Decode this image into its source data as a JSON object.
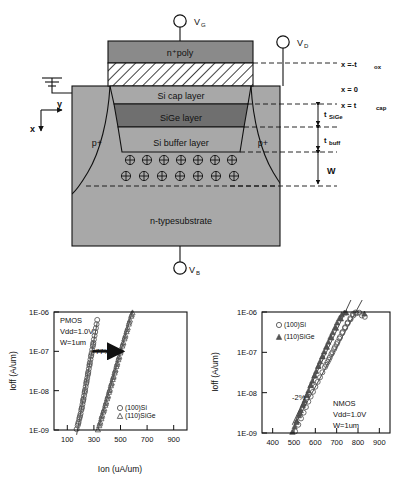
{
  "diagram": {
    "name": "MOSFET cross-section",
    "terminals": [
      {
        "id": "gate",
        "label": "V",
        "sub": "G"
      },
      {
        "id": "drain",
        "label": "V",
        "sub": "D"
      },
      {
        "id": "body",
        "label": "V",
        "sub": "B"
      }
    ],
    "axes": {
      "horizontal": "y",
      "vertical": "x"
    },
    "layers": [
      {
        "id": "poly",
        "label": "n⁺poly",
        "fill": "#8a8a8a"
      },
      {
        "id": "oxide",
        "label": "",
        "fill": "hatch"
      },
      {
        "id": "cap",
        "label": "Si cap layer",
        "fill": "#a8a8a8"
      },
      {
        "id": "sige",
        "label": "SiGe layer",
        "fill": "#6f6f6f"
      },
      {
        "id": "buffer",
        "label": "Si buffer layer",
        "fill": "#a8a8a8"
      },
      {
        "id": "substrate",
        "label": "n-typesubstrate",
        "fill": "#a8a8a8"
      }
    ],
    "source_label": "p+",
    "drain_label": "p+",
    "depletion_charge_symbol": "⊕",
    "depletion_rows": 2,
    "depletion_cols": 7,
    "markers": [
      {
        "id": "tox",
        "text": "x =-t",
        "sub": "ox"
      },
      {
        "id": "x0",
        "text": "x  =  0",
        "sub": ""
      },
      {
        "id": "xcap",
        "text": "x  =  t",
        "sub": "cap"
      },
      {
        "id": "tsige",
        "text": "t",
        "sub": "SiGe"
      },
      {
        "id": "tbuff",
        "text": "t",
        "sub": "buff"
      },
      {
        "id": "w",
        "text": "W",
        "sub": ""
      }
    ],
    "ground_symbol": "ground"
  },
  "chart_data": [
    {
      "id": "pmos",
      "type": "scatter",
      "title": "",
      "xlabel": "Ion (uA/um)",
      "ylabel": "Ioff (A/um)",
      "xlim": [
        0,
        1000
      ],
      "xticks": [
        100,
        300,
        500,
        700,
        900
      ],
      "ylim_exp": [
        -9,
        -6
      ],
      "yticks": [
        "1E-06",
        "1E-07",
        "1E-08",
        "1E-09"
      ],
      "grid": false,
      "legend_position": "bottom-right",
      "annotations": [
        {
          "id": "device",
          "text": "PMOS"
        },
        {
          "id": "vdd",
          "text": "Vdd=1.0V"
        },
        {
          "id": "width",
          "text": "W=1um"
        },
        {
          "id": "gain",
          "text": "+77%"
        }
      ],
      "arrow": {
        "from_x": 290,
        "to_x": 515,
        "at_y": "1E-07",
        "label": "+77%"
      },
      "series": [
        {
          "name": "(100)Si",
          "marker": "circle",
          "points": [
            [
              170,
              1.05e-09
            ],
            [
              178,
              1.3e-09
            ],
            [
              185,
              1.6e-09
            ],
            [
              190,
              1.9e-09
            ],
            [
              196,
              2.3e-09
            ],
            [
              200,
              2.6e-09
            ],
            [
              205,
              3.2e-09
            ],
            [
              210,
              3.8e-09
            ],
            [
              214,
              4.5e-09
            ],
            [
              218,
              5.3e-09
            ],
            [
              222,
              6.2e-09
            ],
            [
              226,
              7.4e-09
            ],
            [
              230,
              8.8e-09
            ],
            [
              234,
              1.05e-08
            ],
            [
              238,
              1.25e-08
            ],
            [
              242,
              1.5e-08
            ],
            [
              246,
              1.8e-08
            ],
            [
              250,
              2.1e-08
            ],
            [
              254,
              2.5e-08
            ],
            [
              258,
              3e-08
            ],
            [
              262,
              3.6e-08
            ],
            [
              266,
              4.3e-08
            ],
            [
              270,
              5.2e-08
            ],
            [
              274,
              6.2e-08
            ],
            [
              278,
              7.4e-08
            ],
            [
              283,
              9e-08
            ],
            [
              287,
              1.1e-07
            ],
            [
              292,
              1.35e-07
            ],
            [
              296,
              1.65e-07
            ],
            [
              300,
              2e-07
            ],
            [
              305,
              2.5e-07
            ],
            [
              310,
              3.1e-07
            ],
            [
              315,
              3.9e-07
            ],
            [
              320,
              4.9e-07
            ],
            [
              325,
              6.3e-07
            ],
            [
              182,
              1.45e-09
            ],
            [
              193,
              2.1e-09
            ],
            [
              208,
              3.5e-09
            ],
            [
              220,
              5.8e-09
            ],
            [
              232,
              9.6e-09
            ],
            [
              244,
              1.65e-08
            ],
            [
              256,
              2.75e-08
            ],
            [
              268,
              4.7e-08
            ],
            [
              280,
              8e-08
            ],
            [
              294,
              1.5e-07
            ]
          ]
        },
        {
          "name": "(110)SiGe",
          "marker": "triangle",
          "points": [
            [
              330,
              1.02e-09
            ],
            [
              340,
              1.3e-09
            ],
            [
              348,
              1.6e-09
            ],
            [
              356,
              1.95e-09
            ],
            [
              362,
              2.4e-09
            ],
            [
              370,
              2.9e-09
            ],
            [
              378,
              3.5e-09
            ],
            [
              385,
              4.3e-09
            ],
            [
              392,
              5.2e-09
            ],
            [
              399,
              6.3e-09
            ],
            [
              406,
              7.6e-09
            ],
            [
              413,
              9.2e-09
            ],
            [
              420,
              1.1e-08
            ],
            [
              427,
              1.35e-08
            ],
            [
              434,
              1.6e-08
            ],
            [
              441,
              1.95e-08
            ],
            [
              448,
              2.35e-08
            ],
            [
              455,
              2.85e-08
            ],
            [
              462,
              3.45e-08
            ],
            [
              469,
              4.2e-08
            ],
            [
              476,
              5.1e-08
            ],
            [
              483,
              6.2e-08
            ],
            [
              490,
              7.5e-08
            ],
            [
              498,
              9.2e-08
            ],
            [
              505,
              1.12e-07
            ],
            [
              513,
              1.38e-07
            ],
            [
              521,
              1.7e-07
            ],
            [
              529,
              2.1e-07
            ],
            [
              537,
              2.6e-07
            ],
            [
              545,
              3.2e-07
            ],
            [
              554,
              4e-07
            ],
            [
              562,
              5e-07
            ],
            [
              571,
              6.3e-07
            ],
            [
              580,
              7.9e-07
            ],
            [
              590,
              9.6e-07
            ],
            [
              344,
              1.45e-09
            ],
            [
              358,
              2.2e-09
            ],
            [
              374,
              3.2e-09
            ],
            [
              389,
              4.8e-09
            ],
            [
              403,
              7e-09
            ],
            [
              417,
              1.02e-08
            ],
            [
              431,
              1.5e-08
            ],
            [
              445,
              2.2e-08
            ],
            [
              459,
              3.2e-08
            ],
            [
              473,
              4.7e-08
            ],
            [
              487,
              6.9e-08
            ],
            [
              501,
              1.02e-07
            ],
            [
              517,
              1.55e-07
            ],
            [
              533,
              2.35e-07
            ],
            [
              549,
              3.6e-07
            ],
            [
              566,
              5.6e-07
            ],
            [
              584,
              8.6e-07
            ]
          ]
        }
      ]
    },
    {
      "id": "nmos",
      "type": "scatter",
      "title": "",
      "xlabel": "",
      "ylabel": "Ioff (A/um)",
      "xlim": [
        350,
        950
      ],
      "xticks": [
        400,
        500,
        600,
        700,
        800,
        900
      ],
      "ylim_exp": [
        -9,
        -6
      ],
      "yticks": [
        "1E-06",
        "1E-07",
        "1E-08",
        "1E-09"
      ],
      "grid": false,
      "legend_position": "top-left",
      "annotations": [
        {
          "id": "device",
          "text": "NMOS"
        },
        {
          "id": "vdd",
          "text": "Vdd=1.0V"
        },
        {
          "id": "width",
          "text": "W=1um"
        },
        {
          "id": "gain",
          "text": "-2%"
        }
      ],
      "series": [
        {
          "name": "(100)Si",
          "marker": "circle",
          "points": [
            [
              505,
              1.1e-09
            ],
            [
              520,
              1.6e-09
            ],
            [
              533,
              2.3e-09
            ],
            [
              545,
              3.2e-09
            ],
            [
              556,
              4.4e-09
            ],
            [
              567,
              6e-09
            ],
            [
              578,
              8e-09
            ],
            [
              589,
              1.05e-08
            ],
            [
              600,
              1.4e-08
            ],
            [
              611,
              1.85e-08
            ],
            [
              622,
              2.4e-08
            ],
            [
              633,
              3.2e-08
            ],
            [
              645,
              4.3e-08
            ],
            [
              657,
              5.7e-08
            ],
            [
              668,
              7.5e-08
            ],
            [
              680,
              1e-07
            ],
            [
              692,
              1.35e-07
            ],
            [
              704,
              1.8e-07
            ],
            [
              716,
              2.4e-07
            ],
            [
              728,
              3.2e-07
            ],
            [
              740,
              4.2e-07
            ],
            [
              752,
              5.5e-07
            ],
            [
              764,
              7e-07
            ],
            [
              776,
              8.8e-07
            ],
            [
              788,
              9.7e-07
            ],
            [
              650,
              4.9e-08
            ],
            [
              663,
              6.6e-08
            ],
            [
              675,
              9e-08
            ],
            [
              688,
              1.2e-07
            ],
            [
              700,
              1.6e-07
            ],
            [
              713,
              2.2e-07
            ],
            [
              726,
              3e-07
            ],
            [
              739,
              4e-07
            ],
            [
              751,
              5.2e-07
            ],
            [
              765,
              6.6e-07
            ],
            [
              778,
              8.2e-07
            ],
            [
              792,
              9.3e-07
            ],
            [
              806,
              9.6e-07
            ],
            [
              818,
              8.2e-07
            ],
            [
              832,
              7.6e-07
            ]
          ]
        },
        {
          "name": "(110)SiGe",
          "marker": "triangle-f",
          "points": [
            [
              492,
              1.05e-09
            ],
            [
              503,
              1.45e-09
            ],
            [
              513,
              2e-09
            ],
            [
              523,
              2.7e-09
            ],
            [
              532,
              3.6e-09
            ],
            [
              541,
              4.8e-09
            ],
            [
              550,
              6.4e-09
            ],
            [
              559,
              8.5e-09
            ],
            [
              568,
              1.12e-08
            ],
            [
              577,
              1.5e-08
            ],
            [
              586,
              1.95e-08
            ],
            [
              595,
              2.6e-08
            ],
            [
              604,
              3.4e-08
            ],
            [
              613,
              4.5e-08
            ],
            [
              622,
              5.9e-08
            ],
            [
              632,
              7.8e-08
            ],
            [
              641,
              1.03e-07
            ],
            [
              651,
              1.37e-07
            ],
            [
              661,
              1.8e-07
            ],
            [
              671,
              2.4e-07
            ],
            [
              681,
              3.1e-07
            ],
            [
              692,
              4.1e-07
            ],
            [
              702,
              5.4e-07
            ],
            [
              713,
              7e-07
            ],
            [
              724,
              8.6e-07
            ],
            [
              736,
              9.5e-07
            ],
            [
              512,
              1.85e-09
            ],
            [
              528,
              3.1e-09
            ],
            [
              545,
              5.3e-09
            ],
            [
              562,
              9e-09
            ],
            [
              579,
              1.55e-08
            ],
            [
              597,
              2.7e-08
            ],
            [
              615,
              4.6e-08
            ],
            [
              634,
              7.9e-08
            ],
            [
              654,
              1.35e-07
            ],
            [
              675,
              2.3e-07
            ],
            [
              697,
              4e-07
            ],
            [
              720,
              6.8e-07
            ],
            [
              745,
              9.6e-07
            ],
            [
              830,
              9e-07
            ]
          ]
        }
      ]
    }
  ]
}
